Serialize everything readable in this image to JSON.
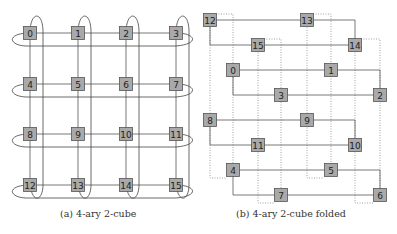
{
  "figures": [
    {
      "id": "a",
      "caption": "(a) 4-ary 2-cube",
      "nodes": [
        {
          "label": "0",
          "x": 30,
          "y": 33
        },
        {
          "label": "1",
          "x": 78,
          "y": 33
        },
        {
          "label": "2",
          "x": 126,
          "y": 33
        },
        {
          "label": "3",
          "x": 176,
          "y": 33
        },
        {
          "label": "4",
          "x": 30,
          "y": 84
        },
        {
          "label": "5",
          "x": 78,
          "y": 84
        },
        {
          "label": "6",
          "x": 126,
          "y": 84
        },
        {
          "label": "7",
          "x": 176,
          "y": 84
        },
        {
          "label": "8",
          "x": 30,
          "y": 134
        },
        {
          "label": "9",
          "x": 78,
          "y": 134
        },
        {
          "label": "10",
          "x": 126,
          "y": 134
        },
        {
          "label": "11",
          "x": 176,
          "y": 134
        },
        {
          "label": "12",
          "x": 30,
          "y": 185
        },
        {
          "label": "13",
          "x": 78,
          "y": 185
        },
        {
          "label": "14",
          "x": 126,
          "y": 185
        },
        {
          "label": "15",
          "x": 176,
          "y": 185
        }
      ]
    },
    {
      "id": "b",
      "caption": "(b) 4-ary 2-cube folded",
      "nodes": [
        {
          "label": "12",
          "x": 210,
          "y": 20
        },
        {
          "label": "13",
          "x": 307,
          "y": 20
        },
        {
          "label": "15",
          "x": 258,
          "y": 45
        },
        {
          "label": "14",
          "x": 355,
          "y": 45
        },
        {
          "label": "0",
          "x": 233,
          "y": 70
        },
        {
          "label": "1",
          "x": 331,
          "y": 70
        },
        {
          "label": "3",
          "x": 281,
          "y": 95
        },
        {
          "label": "2",
          "x": 380,
          "y": 95
        },
        {
          "label": "8",
          "x": 210,
          "y": 120
        },
        {
          "label": "9",
          "x": 307,
          "y": 120
        },
        {
          "label": "11",
          "x": 258,
          "y": 145
        },
        {
          "label": "10",
          "x": 355,
          "y": 145
        },
        {
          "label": "4",
          "x": 233,
          "y": 170
        },
        {
          "label": "5",
          "x": 331,
          "y": 170
        },
        {
          "label": "7",
          "x": 281,
          "y": 195
        },
        {
          "label": "6",
          "x": 380,
          "y": 195
        }
      ]
    }
  ],
  "colors": {
    "node_fill": "#a9a9a9",
    "node_stroke": "#555555",
    "edge": "#555555",
    "dotted_edge": "#888888"
  }
}
